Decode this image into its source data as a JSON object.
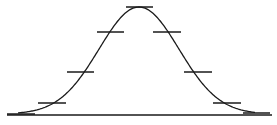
{
  "diagram": {
    "type": "normal-distribution-curve",
    "colors": {
      "background": "#ffffff",
      "stroke": "#1a1a1a"
    },
    "baseline": {
      "x1": 7,
      "x2": 272,
      "y": 115
    },
    "curve": {
      "peak_x": 139,
      "peak_y": 7,
      "base_y": 114,
      "sigma_px": 40,
      "x_start": 18,
      "x_end": 255
    },
    "ticks": [
      {
        "x1": 7,
        "x2": 35,
        "y": 114
      },
      {
        "x1": 38,
        "x2": 66,
        "y": 103
      },
      {
        "x1": 67,
        "x2": 94,
        "y": 72
      },
      {
        "x1": 97,
        "x2": 124,
        "y": 32
      },
      {
        "x1": 126,
        "x2": 153,
        "y": 7
      },
      {
        "x1": 153,
        "x2": 181,
        "y": 32
      },
      {
        "x1": 184,
        "x2": 212,
        "y": 72
      },
      {
        "x1": 213,
        "x2": 241,
        "y": 103
      },
      {
        "x1": 243,
        "x2": 270,
        "y": 113
      }
    ]
  }
}
